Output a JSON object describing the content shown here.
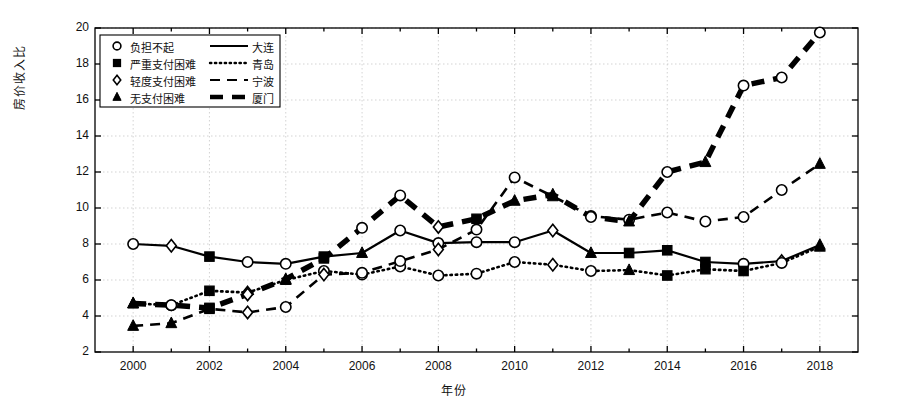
{
  "chart_data": {
    "type": "line",
    "title": "",
    "xlabel": "年份",
    "ylabel": "房价收入比",
    "xlim": [
      1999,
      2019
    ],
    "ylim": [
      2,
      20
    ],
    "ytick_step": 2,
    "xtick_step": 2,
    "grid": true,
    "legend_position": "upper-left-inside",
    "x": [
      2000,
      2001,
      2002,
      2003,
      2004,
      2005,
      2006,
      2007,
      2008,
      2009,
      2010,
      2011,
      2012,
      2013,
      2014,
      2015,
      2016,
      2017,
      2018
    ],
    "xtick_labels": [
      "2000",
      "2002",
      "2004",
      "2006",
      "2008",
      "2010",
      "2012",
      "2014",
      "2016",
      "2018"
    ],
    "ytick_labels": [
      "2",
      "4",
      "6",
      "8",
      "10",
      "12",
      "14",
      "16",
      "18",
      "20"
    ],
    "series": [
      {
        "name": "大连",
        "line_style": "solid",
        "line_width": 2.2,
        "values": [
          8.0,
          7.9,
          7.3,
          7.0,
          6.9,
          7.3,
          7.5,
          8.75,
          8.05,
          8.1,
          8.1,
          8.75,
          7.5,
          7.5,
          7.65,
          7.0,
          6.9,
          7.05,
          7.95
        ],
        "markers": [
          "circle",
          "diamond",
          "square",
          "circle",
          "circle",
          "square",
          "triangle",
          "circle",
          "circle",
          "circle",
          "circle",
          "diamond",
          "triangle",
          "square",
          "square",
          "square",
          "circle",
          "diamond",
          "triangle"
        ]
      },
      {
        "name": "青岛",
        "line_style": "dotted",
        "line_width": 2.6,
        "values": [
          4.7,
          4.6,
          5.4,
          5.3,
          6.0,
          6.5,
          6.3,
          6.75,
          6.25,
          6.35,
          7.0,
          6.85,
          6.5,
          6.55,
          6.25,
          6.6,
          6.5,
          6.95,
          7.85
        ],
        "markers": [
          "triangle",
          "circle",
          "square",
          "diamond",
          "triangle",
          "circle",
          "circle",
          "circle",
          "circle",
          "circle",
          "circle",
          "diamond",
          "circle",
          "triangle",
          "square",
          "square",
          "square",
          "circle",
          "triangle"
        ]
      },
      {
        "name": "宁波",
        "line_style": "dashed",
        "line_width": 2.6,
        "values": [
          3.45,
          3.6,
          4.4,
          4.2,
          4.5,
          6.3,
          6.4,
          7.05,
          7.7,
          8.8,
          11.7,
          10.65,
          9.55,
          9.35,
          9.75,
          9.25,
          9.5,
          11.0,
          12.45
        ],
        "markers": [
          "triangle",
          "triangle",
          "square",
          "diamond",
          "circle",
          "diamond",
          "circle",
          "circle",
          "diamond",
          "circle",
          "circle",
          "triangle",
          "circle",
          "circle",
          "circle",
          "circle",
          "circle",
          "circle",
          "triangle"
        ]
      },
      {
        "name": "厦门",
        "line_style": "thick-dashed",
        "line_width": 5.5,
        "values": [
          4.7,
          4.6,
          4.45,
          5.2,
          6.05,
          7.2,
          8.9,
          10.7,
          8.95,
          9.4,
          10.4,
          10.75,
          9.5,
          9.25,
          12.0,
          12.55,
          16.8,
          17.25,
          19.75
        ],
        "markers": [
          "triangle",
          "circle",
          "square",
          "diamond",
          "triangle",
          "square",
          "circle",
          "circle",
          "diamond",
          "square",
          "triangle",
          "triangle",
          "circle",
          "triangle",
          "circle",
          "triangle",
          "circle",
          "circle",
          "circle"
        ]
      }
    ],
    "legend": {
      "marker_entries": [
        {
          "marker": "circle",
          "label": "负担不起"
        },
        {
          "marker": "square",
          "label": "严重支付困难"
        },
        {
          "marker": "diamond",
          "label": "轻度支付困难"
        },
        {
          "marker": "triangle",
          "label": "无支付困难"
        }
      ],
      "line_entries": [
        {
          "line_style": "solid",
          "label": "大连"
        },
        {
          "line_style": "dotted",
          "label": "青岛"
        },
        {
          "line_style": "dashed",
          "label": "宁波"
        },
        {
          "line_style": "thick-dashed",
          "label": "厦门"
        }
      ]
    },
    "colors": {
      "line": "#000000",
      "marker_fill_open": "#ffffff",
      "marker_fill_solid": "#000000",
      "grid": "#c8c8c8",
      "axis": "#000000",
      "background": "#ffffff"
    }
  }
}
